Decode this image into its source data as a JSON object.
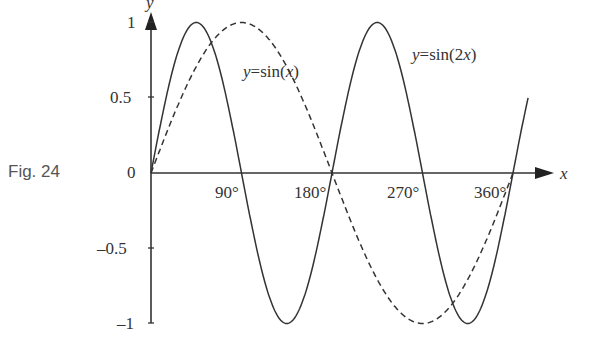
{
  "figure": {
    "label": "Fig. 24"
  },
  "chart_data": {
    "type": "line",
    "title": "",
    "xlabel": "x",
    "ylabel": "y",
    "x_unit": "degrees",
    "xlim": [
      0,
      375
    ],
    "ylim": [
      -1,
      1
    ],
    "x_ticks": [
      "90°",
      "180°",
      "270°",
      "360°"
    ],
    "y_ticks": [
      "1",
      "0.5",
      "0",
      "–0.5",
      "–1"
    ],
    "grid": false,
    "legend": "inline annotations",
    "series": [
      {
        "name": "y = sin(x)",
        "style": "dashed",
        "function": "sin(x)",
        "x": [
          0,
          45,
          90,
          135,
          180,
          225,
          270,
          315,
          360
        ],
        "values": [
          0,
          0.71,
          1,
          0.71,
          0,
          -0.71,
          -1,
          -0.71,
          0
        ]
      },
      {
        "name": "y = sin(2x)",
        "style": "solid",
        "function": "sin(2x)",
        "x": [
          0,
          45,
          90,
          135,
          180,
          225,
          270,
          315,
          360,
          375
        ],
        "values": [
          0,
          1,
          0,
          -1,
          0,
          1,
          0,
          -1,
          0,
          0.5
        ]
      }
    ],
    "annotations": [
      {
        "text": "y = sin(x)",
        "near": "x≈135°, y≈0.6"
      },
      {
        "text": "y = sin(2x)",
        "near": "x≈280°, y≈0.8"
      }
    ]
  }
}
